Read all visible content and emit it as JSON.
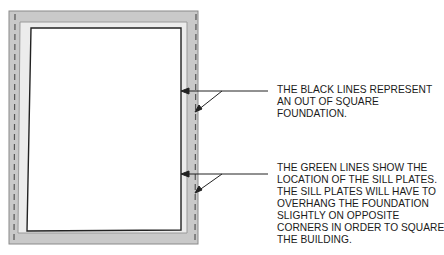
{
  "diagram": {
    "colors": {
      "foundation_fill": "#c9c9c9",
      "foundation_edge": "#8a8a8a",
      "inner_band": "#ececec",
      "black_line": "#222222",
      "sill_dashed_line": "#555555",
      "leader_line": "#222222",
      "text": "#1a1a1a"
    },
    "callouts": [
      {
        "id": "black-lines",
        "lines": [
          "THE BLACK LINES REPRESENT",
          "AN OUT OF SQUARE",
          "FOUNDATION."
        ]
      },
      {
        "id": "green-lines",
        "lines": [
          "THE GREEN LINES SHOW THE",
          "LOCATION OF THE SILL PLATES.",
          "THE SILL PLATES WILL HAVE TO",
          "OVERHANG THE FOUNDATION",
          "SLIGHTLY ON OPPOSITE",
          "CORNERS IN ORDER TO SQUARE",
          "THE BUILDING."
        ]
      }
    ]
  }
}
